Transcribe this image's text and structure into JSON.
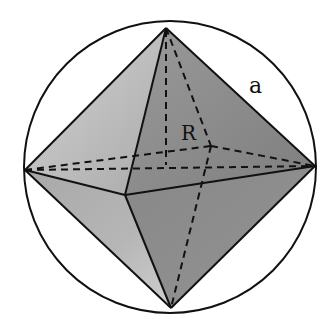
{
  "diagram": {
    "labels": {
      "edge": "a",
      "radius": "R"
    },
    "vertices": {
      "top": [
        166,
        28
      ],
      "bottom": [
        171,
        308
      ],
      "left": [
        25,
        170
      ],
      "right": [
        315,
        166
      ],
      "front": [
        125,
        195
      ],
      "back": [
        211,
        146
      ],
      "center": [
        166,
        152
      ]
    },
    "circle": {
      "cx": 170,
      "cy": 167,
      "r": 146
    },
    "colors": {
      "stroke": "#111111",
      "face_upper_left": "#bdbdbd",
      "face_upper_right": "#8e8e8e",
      "face_lower_left": "#b0b0b0",
      "face_lower_right": "#8a8a8a",
      "background": "#ffffff"
    }
  }
}
